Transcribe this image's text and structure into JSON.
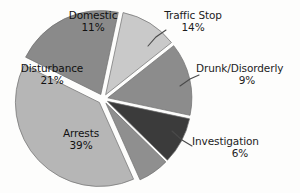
{
  "chart_data": {
    "type": "pie",
    "title": "",
    "subtitle": "",
    "xlabel": "",
    "ylabel": "",
    "legend_position": "none",
    "grid": false,
    "exploded": true,
    "units": "percent",
    "categories": [
      "Domestic",
      "Traffic Stop",
      "Drunk/Disorderly",
      "Investigation",
      "Arrests",
      "Disturbance"
    ],
    "values": [
      11,
      14,
      9,
      6,
      39,
      21
    ],
    "slices": [
      {
        "label": "Domestic",
        "value": 11,
        "value_text": "11%",
        "color": "#c9c9c9",
        "label_placement": "inside"
      },
      {
        "label": "Traffic Stop",
        "value": 14,
        "value_text": "14%",
        "color": "#8c8c8c",
        "label_placement": "outside-leader"
      },
      {
        "label": "Drunk/Disorderly",
        "value": 9,
        "value_text": "9%",
        "color": "#3b3b3b",
        "label_placement": "outside-leader"
      },
      {
        "label": "Investigation",
        "value": 6,
        "value_text": "6%",
        "color": "#8f8f8f",
        "label_placement": "outside-leader"
      },
      {
        "label": "Arrests",
        "value": 39,
        "value_text": "39%",
        "color": "#b6b6b6",
        "label_placement": "inside"
      },
      {
        "label": "Disturbance",
        "value": 21,
        "value_text": "21%",
        "color": "#8a8a8a",
        "label_placement": "inside"
      }
    ]
  },
  "colors": {
    "background": "#fdfdfc",
    "slice_outline": "#6f6f6f",
    "leader_line": "#4a4a4a",
    "label_text": "#1c1c1c"
  }
}
